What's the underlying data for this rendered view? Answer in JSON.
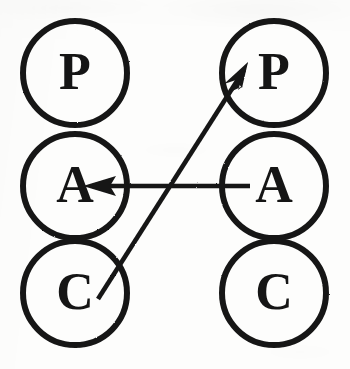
{
  "figure": {
    "background_color": "#fdfdfc",
    "ink_color": "#151515",
    "width": 350,
    "height": 369
  },
  "nodes": [
    {
      "id": "left-p",
      "label": "P",
      "name": "presentation",
      "column": "left",
      "row": "top",
      "cx": 75,
      "cy": 73,
      "r": 52
    },
    {
      "id": "left-a",
      "label": "A",
      "name": "abstraction",
      "column": "left",
      "row": "middle",
      "cx": 75,
      "cy": 186,
      "r": 52
    },
    {
      "id": "left-c",
      "label": "C",
      "name": "control",
      "column": "left",
      "row": "bottom",
      "cx": 75,
      "cy": 293,
      "r": 52
    },
    {
      "id": "right-p",
      "label": "P",
      "name": "presentation",
      "column": "right",
      "row": "top",
      "cx": 274,
      "cy": 73,
      "r": 52
    },
    {
      "id": "right-a",
      "label": "A",
      "name": "abstraction",
      "column": "right",
      "row": "middle",
      "cx": 274,
      "cy": 186,
      "r": 52
    },
    {
      "id": "right-c",
      "label": "C",
      "name": "control",
      "column": "right",
      "row": "bottom",
      "cx": 274,
      "cy": 293,
      "r": 52
    }
  ],
  "arrows": [
    {
      "id": "arrow-right-a-to-left-a",
      "from": "right-a",
      "to": "left-a",
      "orientation": "horizontal",
      "direction": "right-to-left",
      "x1": 250,
      "y1": 186,
      "x2": 84,
      "y2": 186
    },
    {
      "id": "arrow-left-c-to-right-p",
      "from": "left-c",
      "to": "right-p",
      "orientation": "diagonal",
      "direction": "lower-left-to-upper-right",
      "x1": 98,
      "y1": 299,
      "x2": 248,
      "y2": 64
    }
  ],
  "style": {
    "circle_stroke_width": 6,
    "arrow_stroke_width": 4.5,
    "label_font_size_px": 52
  }
}
